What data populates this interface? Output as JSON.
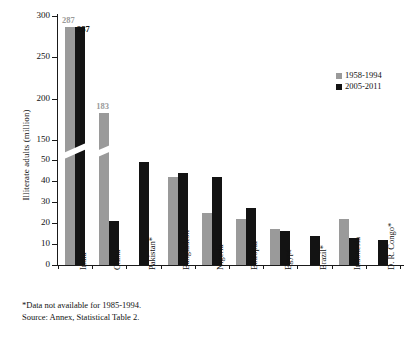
{
  "chart_data": {
    "type": "bar",
    "title": "",
    "xlabel": "",
    "ylabel": "Illiterate adults (million)",
    "ylim": [
      0,
      300
    ],
    "y_ticks": [
      0,
      10,
      20,
      30,
      40,
      50,
      150,
      200,
      250,
      300
    ],
    "axis_break": {
      "from": 50,
      "to": 150
    },
    "grid": false,
    "legend_position": "right",
    "categories": [
      "India",
      "China",
      "Pakistan*",
      "Bangladesh",
      "Nigeria",
      "Ethiopia",
      "Egypt",
      "Brazil*",
      "Indonesia",
      "D. R. Congo*"
    ],
    "series": [
      {
        "name": "1958-1994",
        "color": "#9a9a9a",
        "values": [
          287,
          183,
          null,
          42,
          25,
          22,
          17,
          null,
          22,
          null
        ]
      },
      {
        "name": "2005-2011",
        "color": "#131313",
        "values": [
          287,
          52,
          49,
          44,
          42,
          27,
          16,
          14,
          13,
          12
        ]
      }
    ],
    "data_labels": [
      {
        "category": "India",
        "series": "1958-1994",
        "text": "287"
      },
      {
        "category": "India",
        "series": "2005-2011",
        "text": "287"
      },
      {
        "category": "China",
        "series": "1958-1994",
        "text": "183"
      }
    ],
    "annotations": [
      "*Data not available for 1985-1994.",
      "Source: Annex, Statistical Table 2."
    ]
  },
  "legend": {
    "items": [
      {
        "label": "1958-1994",
        "color": "#9a9a9a"
      },
      {
        "label": "2005-2011",
        "color": "#131313"
      }
    ]
  },
  "footnotes": {
    "note": "*Data not available for 1985-1994.",
    "source": "Source: Annex, Statistical Table 2."
  }
}
